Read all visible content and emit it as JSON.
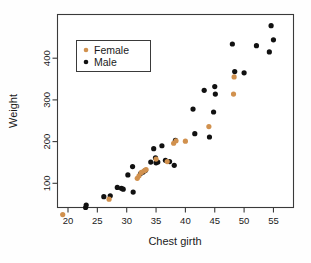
{
  "chart_data": {
    "type": "scatter",
    "title": "",
    "xlabel": "Chest girth",
    "ylabel": "Weight",
    "xlim": [
      18.0,
      57.0
    ],
    "ylim": [
      10,
      490
    ],
    "grid": false,
    "legend_position": "top-left-inside",
    "xticks": [
      20,
      25,
      30,
      35,
      40,
      45,
      50,
      55
    ],
    "yticks": [
      100,
      200,
      300,
      400
    ],
    "colors": {
      "female": "#d1914e",
      "male": "#111111",
      "axis": "#3a3a3a",
      "background": "#ffffff"
    },
    "series": [
      {
        "name": "Female",
        "color": "#d1914e",
        "marker": "circle",
        "points": [
          [
            19.1,
            25
          ],
          [
            27.0,
            62
          ],
          [
            31.8,
            112
          ],
          [
            32.1,
            118
          ],
          [
            32.5,
            126
          ],
          [
            33.0,
            130
          ],
          [
            33.3,
            133
          ],
          [
            35.0,
            158
          ],
          [
            36.9,
            152
          ],
          [
            38.0,
            196
          ],
          [
            38.4,
            202
          ],
          [
            40.0,
            201
          ],
          [
            44.0,
            236
          ],
          [
            48.2,
            314
          ],
          [
            48.3,
            355
          ]
        ]
      },
      {
        "name": "Male",
        "color": "#111111",
        "marker": "circle",
        "points": [
          [
            23.0,
            42
          ],
          [
            23.1,
            48
          ],
          [
            26.1,
            68
          ],
          [
            27.2,
            70
          ],
          [
            28.4,
            90
          ],
          [
            29.1,
            88
          ],
          [
            29.4,
            86
          ],
          [
            30.2,
            120
          ],
          [
            31.0,
            140
          ],
          [
            31.1,
            79
          ],
          [
            32.4,
            124
          ],
          [
            32.8,
            127
          ],
          [
            33.2,
            131
          ],
          [
            34.1,
            151
          ],
          [
            34.6,
            183
          ],
          [
            34.9,
            161
          ],
          [
            35.0,
            149
          ],
          [
            35.3,
            151
          ],
          [
            36.0,
            190
          ],
          [
            36.6,
            155
          ],
          [
            37.3,
            152
          ],
          [
            38.1,
            143
          ],
          [
            38.3,
            203
          ],
          [
            41.3,
            278
          ],
          [
            41.6,
            219
          ],
          [
            43.2,
            323
          ],
          [
            44.1,
            211
          ],
          [
            44.8,
            271
          ],
          [
            45.0,
            332
          ],
          [
            45.1,
            314
          ],
          [
            48.0,
            434
          ],
          [
            48.4,
            368
          ],
          [
            50.0,
            365
          ],
          [
            52.1,
            430
          ],
          [
            54.3,
            415
          ],
          [
            54.6,
            478
          ],
          [
            55.0,
            444
          ]
        ]
      }
    ]
  },
  "legend": {
    "entries": [
      {
        "label": "Female",
        "color": "#d1914e"
      },
      {
        "label": "Male",
        "color": "#111111"
      }
    ]
  },
  "axes": {
    "x_title": "Chest girth",
    "y_title": "Weight"
  }
}
